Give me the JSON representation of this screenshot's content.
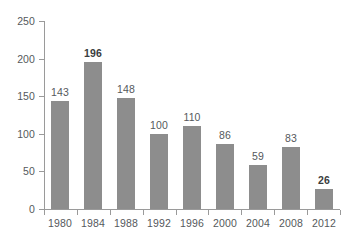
{
  "chart_data": {
    "type": "bar",
    "title": "",
    "subtitle": "",
    "xlabel": "",
    "ylabel": "",
    "categories": [
      "1980",
      "1984",
      "1988",
      "1992",
      "1996",
      "2000",
      "2004",
      "2008",
      "2012"
    ],
    "values": [
      143,
      196,
      148,
      100,
      110,
      86,
      59,
      83,
      26
    ],
    "data_labels": [
      "143",
      "196",
      "148",
      "100",
      "110",
      "86",
      "59",
      "83",
      "26"
    ],
    "emphasized": [
      false,
      true,
      false,
      false,
      false,
      false,
      false,
      false,
      true
    ],
    "ylim": [
      0,
      250
    ],
    "ytick_values": [
      0,
      50,
      100,
      150,
      200,
      250
    ],
    "ytick_labels": [
      "0",
      "50",
      "100",
      "150",
      "200",
      "250"
    ],
    "grid": false,
    "legend": null,
    "legend_position": "none",
    "bar_color": "#8d8d8d",
    "axis_color": "#9a9a9a",
    "label_color": "#55595c",
    "emphasis_color": "#3a3d40",
    "background": "#ffffff"
  }
}
